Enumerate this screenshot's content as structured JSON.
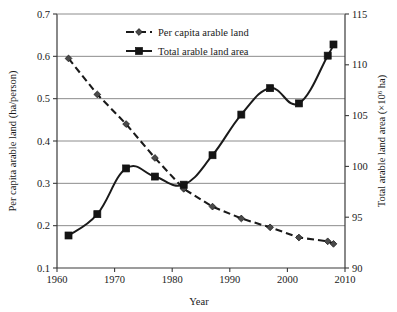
{
  "chart_data": {
    "type": "line",
    "title": "",
    "subtitle": "",
    "xlabel": "Year",
    "ylabel": "Per capita arable land (ha/person)",
    "y2label_prefix": "Total arable land area (×10",
    "y2label_exp": "6",
    "y2label_suffix": " ha)",
    "xlim": [
      1960,
      2010
    ],
    "ylim": [
      0.1,
      0.7
    ],
    "y2lim": [
      90,
      115
    ],
    "xticks": [
      "1960",
      "1970",
      "1980",
      "1990",
      "2000",
      "2010"
    ],
    "xtick_values": [
      1960,
      1970,
      1980,
      1990,
      2000,
      2010
    ],
    "yticks": [
      "0.1",
      "0.2",
      "0.3",
      "0.4",
      "0.5",
      "0.6",
      "0.7"
    ],
    "ytick_values": [
      0.1,
      0.2,
      0.3,
      0.4,
      0.5,
      0.6,
      0.7
    ],
    "y2ticks": [
      "90",
      "95",
      "100",
      "105",
      "110",
      "115"
    ],
    "y2tick_values": [
      90,
      95,
      100,
      105,
      110,
      115
    ],
    "grid": "horizontal",
    "legend_position": "top-center",
    "series": [
      {
        "name": "Per capita arable land",
        "axis": "left",
        "marker": "diamond",
        "linestyle": "dashed",
        "color": "#1a1a1a",
        "x": [
          1962,
          1967,
          1972,
          1977,
          1982,
          1987,
          1992,
          1997,
          2002,
          2007,
          2008
        ],
        "values": [
          0.595,
          0.51,
          0.44,
          0.36,
          0.287,
          0.245,
          0.217,
          0.196,
          0.172,
          0.163,
          0.157
        ]
      },
      {
        "name": "Total arable land area",
        "axis": "right",
        "marker": "square",
        "linestyle": "solid",
        "color": "#1a1a1a",
        "x": [
          1962,
          1967,
          1972,
          1977,
          1982,
          1987,
          1992,
          1997,
          2002,
          2007,
          2008
        ],
        "values": [
          93.2,
          95.3,
          99.8,
          99.0,
          98.2,
          101.1,
          105.1,
          107.7,
          106.2,
          110.9,
          112.0
        ],
        "values_left_equivalent": [
          0.177,
          0.223,
          0.322,
          0.304,
          0.287,
          0.358,
          0.452,
          0.525,
          0.488,
          0.595,
          0.618
        ]
      }
    ],
    "annotations": []
  },
  "legend": {
    "items": [
      {
        "label": "Per capita arable land",
        "marker": "diamond",
        "linestyle": "dashed"
      },
      {
        "label": "Total arable land area",
        "marker": "square",
        "linestyle": "solid"
      }
    ]
  },
  "colors": {
    "axis": "#3a3a3a",
    "grid": "#8c8c8c",
    "series": "#1a1a1a",
    "background": "#ffffff"
  }
}
